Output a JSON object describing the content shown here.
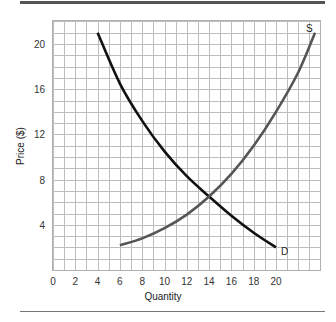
{
  "chart_data": {
    "type": "line",
    "title": "",
    "xlabel": "Quantity",
    "ylabel": "Price ($)",
    "xlim": [
      0,
      24
    ],
    "ylim": [
      0,
      22
    ],
    "x_ticks": [
      0,
      2,
      4,
      6,
      8,
      10,
      12,
      14,
      16,
      18,
      20
    ],
    "y_ticks": [
      4,
      8,
      12,
      16,
      20
    ],
    "grid": true,
    "grid_step": 1,
    "legend": "none (curves labeled inline)",
    "series": [
      {
        "name": "D",
        "label": "D",
        "color": "#111111",
        "x": [
          4,
          6,
          8,
          10,
          12,
          14,
          16,
          18,
          20
        ],
        "y": [
          21,
          16.5,
          13.2,
          10.5,
          8.3,
          6.5,
          4.8,
          3.3,
          2
        ]
      },
      {
        "name": "S",
        "label": "S",
        "color": "#555555",
        "x": [
          6,
          8,
          10,
          12,
          14,
          16,
          18,
          20,
          22,
          23.5
        ],
        "y": [
          2.2,
          2.8,
          3.7,
          4.9,
          6.5,
          8.5,
          11,
          14,
          17.5,
          21
        ]
      }
    ],
    "annotations": [
      {
        "text": "S",
        "at": [
          23.2,
          21.5
        ]
      },
      {
        "text": "D",
        "at": [
          20.5,
          1.8
        ]
      },
      {
        "text": "equilibrium (intersection)",
        "at": [
          14,
          6.5
        ]
      }
    ]
  },
  "labels": {
    "x_axis": "Quantity",
    "y_axis": "Price ($)",
    "supply": "S",
    "demand": "D",
    "x_ticks": [
      "0",
      "2",
      "4",
      "6",
      "8",
      "10",
      "12",
      "14",
      "16",
      "18",
      "20"
    ],
    "y_ticks": [
      "20",
      "16",
      "12",
      "8",
      "4"
    ]
  }
}
